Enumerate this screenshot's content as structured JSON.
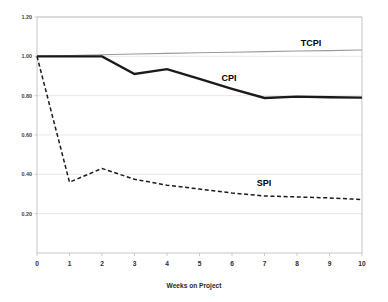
{
  "chart_data": {
    "type": "line",
    "title": "",
    "xlabel": "Weeks on Project",
    "ylabel": "",
    "x": [
      0,
      1,
      2,
      3,
      4,
      5,
      6,
      7,
      8,
      9,
      10
    ],
    "xlim": [
      0,
      10
    ],
    "ylim": [
      0,
      1.2
    ],
    "grid": true,
    "legend_position": "inline-annotations",
    "xtick_labels": [
      "0",
      "1",
      "2",
      "3",
      "4",
      "5",
      "6",
      "7",
      "8",
      "9",
      "10"
    ],
    "ytick_labels": [
      "1.20",
      "1.00",
      "0.80",
      "0.60",
      "0.40",
      "0.20"
    ],
    "ytick_values": [
      1.2,
      1.0,
      0.8,
      0.6,
      0.4,
      0.2
    ],
    "series": [
      {
        "name": "TCPI",
        "style": "solid-thin-gray",
        "color": "#9a9a9a",
        "values": [
          1.0,
          1.004,
          1.008,
          1.012,
          1.015,
          1.018,
          1.021,
          1.024,
          1.027,
          1.029,
          1.032
        ],
        "label_text": "TCPI"
      },
      {
        "name": "CPI",
        "style": "solid-thick-black",
        "color": "#1a1a1a",
        "values": [
          1.0,
          1.0,
          1.0,
          0.91,
          0.935,
          0.885,
          0.835,
          0.788,
          0.795,
          0.792,
          0.79
        ],
        "label_text": "CPI"
      },
      {
        "name": "SPI",
        "style": "dashed-black",
        "color": "#1a1a1a",
        "values": [
          1.0,
          0.36,
          0.43,
          0.375,
          0.345,
          0.325,
          0.305,
          0.29,
          0.285,
          0.28,
          0.272
        ],
        "label_text": "SPI"
      }
    ],
    "annotations": [
      {
        "text": "TCPI",
        "x_px": 311,
        "y_px": 46
      },
      {
        "text": "CPI",
        "x_px": 229,
        "y_px": 81
      },
      {
        "text": "SPI",
        "x_px": 264,
        "y_px": 186
      }
    ]
  }
}
